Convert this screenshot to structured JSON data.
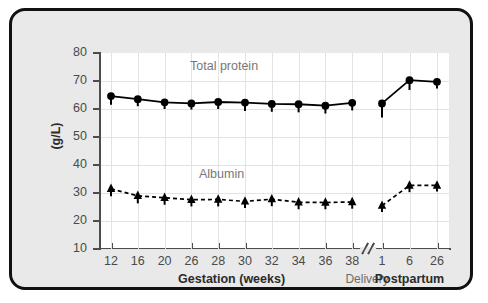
{
  "figure": {
    "frame_bg": "#e9e9e9",
    "plot_bg": "#ffffff",
    "border_color": "#111111",
    "grid_color": "#e3e3e3",
    "axis_color": "#4d4d4d",
    "series_color": "#000000",
    "label_color": "#777777"
  },
  "axis": {
    "y_title": "(g/L)",
    "y_ticks": [
      "80",
      "70",
      "60",
      "50",
      "40",
      "30",
      "20",
      "10"
    ],
    "y_values": [
      80,
      70,
      60,
      50,
      40,
      30,
      20,
      10
    ],
    "x_gestation_label": "Gestation (weeks)",
    "x_postpartum_label": "Postpartum",
    "x_delivery_label": "Delivery",
    "break_glyph": "//"
  },
  "series_labels": {
    "total_protein": "Total protein",
    "albumin": "Albumin"
  },
  "chart_data": {
    "type": "line",
    "title": "",
    "xlabel": "Gestation (weeks) / Postpartum",
    "ylabel": "(g/L)",
    "ylim": [
      10,
      80
    ],
    "ytick_step": 10,
    "grid": true,
    "legend": "inline-annotation",
    "axis_break": {
      "after_category": "38",
      "before_category": "1",
      "label": "Delivery",
      "glyph": "//"
    },
    "x_groups": [
      {
        "name": "Gestation (weeks)",
        "categories": [
          "12",
          "16",
          "20",
          "26",
          "28",
          "30",
          "32",
          "34",
          "36",
          "38"
        ]
      },
      {
        "name": "Postpartum",
        "categories": [
          "1",
          "6",
          "26"
        ]
      }
    ],
    "categories": [
      "12",
      "16",
      "20",
      "26",
      "28",
      "30",
      "32",
      "34",
      "36",
      "38",
      "1",
      "6",
      "26"
    ],
    "series": [
      {
        "name": "Total protein",
        "marker": "circle",
        "line": "solid",
        "values": [
          64.6,
          63.5,
          62.4,
          62.0,
          62.5,
          62.3,
          61.8,
          61.7,
          61.2,
          62.2,
          62.0,
          70.3,
          69.7
        ],
        "error_low": [
          61.5,
          61.0,
          60.0,
          59.8,
          60.0,
          59.3,
          59.0,
          58.8,
          58.4,
          59.5,
          57.0,
          66.8,
          67.3
        ]
      },
      {
        "name": "Albumin",
        "marker": "triangle",
        "line": "dashed",
        "values": [
          31.5,
          29.0,
          28.3,
          27.6,
          27.7,
          27.0,
          27.8,
          26.7,
          26.6,
          26.8,
          25.5,
          32.7,
          32.7
        ],
        "error_low": [
          28.8,
          26.3,
          25.8,
          25.2,
          25.2,
          24.6,
          25.3,
          24.2,
          24.2,
          24.4,
          23.2,
          30.3,
          30.5
        ]
      }
    ]
  }
}
